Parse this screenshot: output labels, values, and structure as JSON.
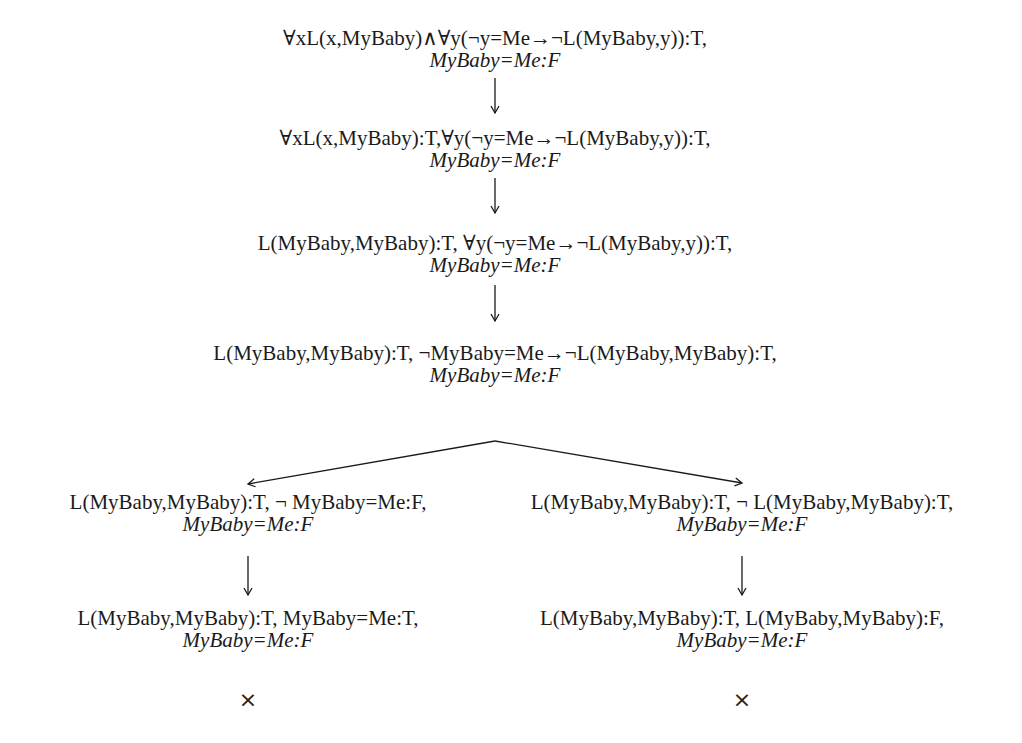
{
  "diagram": {
    "type": "semantic-tableau",
    "nodes": [
      {
        "id": "n1",
        "lines": [
          "∀xL(x,MyBaby)∧∀y(¬y=Me→¬L(MyBaby,y)):T,",
          "MyBaby=Me:F"
        ]
      },
      {
        "id": "n2",
        "lines": [
          "∀xL(x,MyBaby):T,∀y(¬y=Me→¬L(MyBaby,y)):T,",
          "MyBaby=Me:F"
        ]
      },
      {
        "id": "n3",
        "lines": [
          "L(MyBaby,MyBaby):T, ∀y(¬y=Me→¬L(MyBaby,y)):T,",
          "MyBaby=Me:F"
        ]
      },
      {
        "id": "n4",
        "lines": [
          "L(MyBaby,MyBaby):T, ¬MyBaby=Me→¬L(MyBaby,MyBaby):T,",
          "MyBaby=Me:F"
        ]
      },
      {
        "id": "n5l",
        "lines": [
          "L(MyBaby,MyBaby):T, ¬ MyBaby=Me:F,",
          "MyBaby=Me:F"
        ]
      },
      {
        "id": "n5r",
        "lines": [
          "L(MyBaby,MyBaby):T, ¬ L(MyBaby,MyBaby):T,",
          "MyBaby=Me:F"
        ]
      },
      {
        "id": "n6l",
        "lines": [
          "L(MyBaby,MyBaby):T, MyBaby=Me:T,",
          "MyBaby=Me:F"
        ]
      },
      {
        "id": "n6r",
        "lines": [
          "L(MyBaby,MyBaby):T, L(MyBaby,MyBaby):F,",
          "MyBaby=Me:F"
        ]
      }
    ],
    "edges": [
      {
        "from": "n1",
        "to": "n2"
      },
      {
        "from": "n2",
        "to": "n3"
      },
      {
        "from": "n3",
        "to": "n4"
      },
      {
        "from": "n4",
        "to": "n5l"
      },
      {
        "from": "n4",
        "to": "n5r"
      },
      {
        "from": "n5l",
        "to": "n6l"
      },
      {
        "from": "n5r",
        "to": "n6r"
      }
    ],
    "closed_marker": "×",
    "closed_branches": [
      "n6l",
      "n6r"
    ]
  }
}
